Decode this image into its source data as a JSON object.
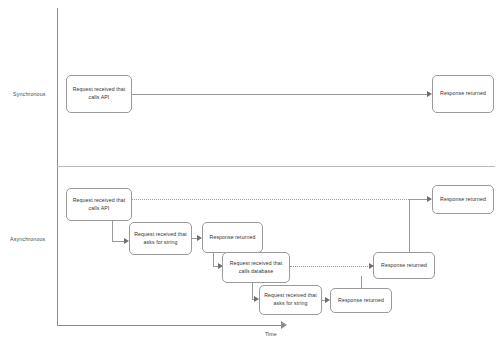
{
  "axes": {
    "y_lanes": [
      {
        "id": "synchronous",
        "label": "Synchronous"
      },
      {
        "id": "asynchronous",
        "label": "Asynchronous"
      }
    ],
    "x_label": "Time"
  },
  "nodes": {
    "sync_request": "Request received that calls API",
    "sync_response": "Response returned",
    "async_request_api": "Request received that calls API",
    "async_request_string_1": "Request received that asks for string",
    "async_response_string_1": "Response returned",
    "async_request_database": "Request received that calls database",
    "async_request_string_2": "Request received that asks for string",
    "async_response_string_2": "Response returned",
    "async_response_database": "Response returned",
    "async_response_api": "Response returned"
  },
  "colors": {
    "stroke": "#9a9a9a",
    "axis": "#8d8d8d",
    "divider": "#b9b9b9",
    "text": "#333333",
    "background": "#ffffff"
  }
}
